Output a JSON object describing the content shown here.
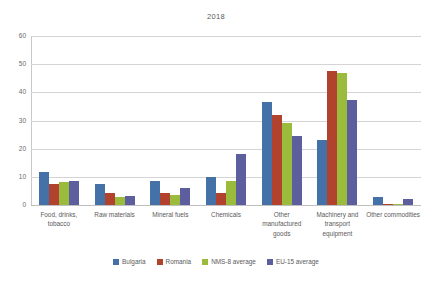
{
  "chart_data": {
    "type": "bar",
    "title": "2018",
    "xlabel": "",
    "ylabel": "",
    "ylim": [
      0,
      60
    ],
    "ytick_step": 10,
    "yticks": [
      0,
      10,
      20,
      30,
      40,
      50,
      60
    ],
    "grid": true,
    "legend_position": "bottom",
    "categories": [
      "Food, drinks, tobacco",
      "Raw materials",
      "Mineral fuels",
      "Chemicals",
      "Other manufactured goods",
      "Machinery and transport equipment",
      "Other commodities"
    ],
    "series": [
      {
        "name": "Bulgaria",
        "color": "#4472a8",
        "values": [
          11.7,
          7.5,
          8.4,
          10.0,
          36.6,
          23.0,
          2.9
        ]
      },
      {
        "name": "Romania",
        "color": "#b1432e",
        "values": [
          7.4,
          4.2,
          4.4,
          4.2,
          31.8,
          47.5,
          0.5
        ]
      },
      {
        "name": "NMS-8 average",
        "color": "#9bbb3c",
        "values": [
          8.1,
          3.0,
          3.7,
          8.7,
          29.0,
          47.0,
          0.3
        ]
      },
      {
        "name": "EU-15 average",
        "color": "#5c5e9e",
        "values": [
          8.6,
          3.1,
          6.1,
          18.2,
          24.6,
          37.3,
          2.0
        ]
      }
    ]
  },
  "axis": {
    "tick_labels": [
      "0",
      "10",
      "20",
      "30",
      "40",
      "50",
      "60"
    ]
  },
  "category_labels": [
    "Food, drinks, tobacco",
    "Raw materials",
    "Mineral fuels",
    "Chemicals",
    "Other manufactured goods",
    "Machinery and transport equipment",
    "Other commodities"
  ],
  "legend": [
    {
      "label": "Bulgaria",
      "color": "#4472a8"
    },
    {
      "label": "Romania",
      "color": "#b1432e"
    },
    {
      "label": "NMS-8 average",
      "color": "#9bbb3c"
    },
    {
      "label": "EU-15 average",
      "color": "#5c5e9e"
    }
  ]
}
